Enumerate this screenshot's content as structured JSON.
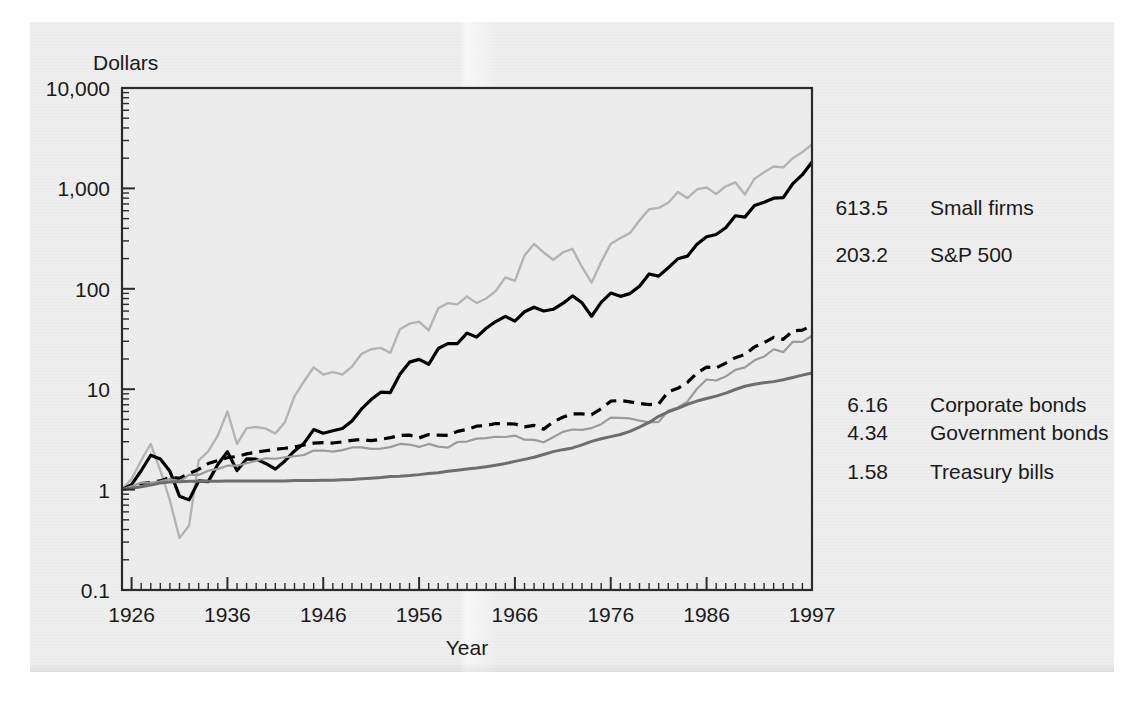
{
  "figure": {
    "y_axis_title": "Dollars",
    "x_axis_title": "Year"
  },
  "chart_data": {
    "type": "line",
    "title": "",
    "subtitle": "",
    "xlabel": "Year",
    "ylabel": "Dollars",
    "yscale": "log",
    "ylim": [
      0.1,
      10000
    ],
    "xlim": [
      1925,
      1997
    ],
    "grid": false,
    "legend_position": "right-inline",
    "ytick_labels": [
      "10,000",
      "1,000",
      "100",
      "10",
      "1",
      "0.1"
    ],
    "ytick_values": [
      10000,
      1000,
      100,
      10,
      1,
      0.1
    ],
    "xtick_labels": [
      "1926",
      "1936",
      "1946",
      "1956",
      "1966",
      "1976",
      "1986",
      "1997"
    ],
    "xtick_values": [
      1926,
      1936,
      1946,
      1956,
      1966,
      1976,
      1986,
      1997
    ],
    "annotations": [
      {
        "value": "613.5",
        "name": "Small firms"
      },
      {
        "value": "203.2",
        "name": "S&P 500"
      },
      {
        "value": "6.16",
        "name": "Corporate bonds"
      },
      {
        "value": "4.34",
        "name": "Government bonds"
      },
      {
        "value": "1.58",
        "name": "Treasury bills"
      }
    ],
    "series": [
      {
        "name": "Small firms",
        "end_value": 613.5,
        "color": "#b4b4b4",
        "style": "solid",
        "width": 2.4,
        "x": [
          1925,
          1926,
          1927,
          1928,
          1929,
          1930,
          1931,
          1932,
          1933,
          1934,
          1935,
          1936,
          1937,
          1938,
          1939,
          1940,
          1941,
          1942,
          1943,
          1944,
          1945,
          1946,
          1947,
          1948,
          1949,
          1950,
          1951,
          1952,
          1953,
          1954,
          1955,
          1956,
          1957,
          1958,
          1959,
          1960,
          1961,
          1962,
          1963,
          1964,
          1965,
          1966,
          1967,
          1968,
          1969,
          1970,
          1971,
          1972,
          1973,
          1974,
          1975,
          1976,
          1977,
          1978,
          1979,
          1980,
          1981,
          1982,
          1983,
          1984,
          1985,
          1986,
          1987,
          1988,
          1989,
          1990,
          1991,
          1992,
          1993,
          1994,
          1995,
          1996,
          1997
        ],
        "values": [
          1.0,
          1.28,
          1.95,
          2.85,
          1.55,
          0.78,
          0.33,
          0.44,
          1.95,
          2.4,
          3.46,
          6.0,
          2.85,
          4.1,
          4.2,
          4.05,
          3.62,
          4.7,
          8.5,
          12.0,
          16.5,
          14.0,
          14.8,
          14.0,
          16.8,
          22.5,
          25.0,
          25.8,
          23.0,
          39.5,
          45.0,
          47.0,
          38.5,
          64.0,
          72.0,
          70.0,
          84.0,
          72.0,
          80.0,
          95.0,
          130.0,
          120.0,
          215.0,
          280.0,
          230.0,
          195.0,
          230.0,
          250.0,
          165.0,
          115.0,
          185.0,
          280.0,
          320.0,
          360.0,
          480.0,
          620.0,
          640.0,
          720.0,
          920.0,
          800.0,
          980.0,
          1020.0,
          880.0,
          1050.0,
          1150.0,
          870.0,
          1250.0,
          1450.0,
          1650.0,
          1620.0,
          2000.0,
          2300.0,
          2750.0
        ]
      },
      {
        "name": "S&P 500",
        "end_value": 203.2,
        "color": "#000000",
        "style": "solid",
        "width": 3.2,
        "x": [
          1925,
          1926,
          1927,
          1928,
          1929,
          1930,
          1931,
          1932,
          1933,
          1934,
          1935,
          1936,
          1937,
          1938,
          1939,
          1940,
          1941,
          1942,
          1943,
          1944,
          1945,
          1946,
          1947,
          1948,
          1949,
          1950,
          1951,
          1952,
          1953,
          1954,
          1955,
          1956,
          1957,
          1958,
          1959,
          1960,
          1961,
          1962,
          1963,
          1964,
          1965,
          1966,
          1967,
          1968,
          1969,
          1970,
          1971,
          1972,
          1973,
          1974,
          1975,
          1976,
          1977,
          1978,
          1979,
          1980,
          1981,
          1982,
          1983,
          1984,
          1985,
          1986,
          1987,
          1988,
          1989,
          1990,
          1991,
          1992,
          1993,
          1994,
          1995,
          1996,
          1997
        ],
        "values": [
          1.0,
          1.12,
          1.54,
          2.2,
          2.02,
          1.52,
          0.86,
          0.79,
          1.22,
          1.2,
          1.78,
          2.38,
          1.55,
          2.02,
          2.01,
          1.82,
          1.6,
          1.93,
          2.43,
          2.9,
          3.96,
          3.64,
          3.85,
          4.06,
          4.83,
          6.36,
          7.89,
          9.34,
          9.25,
          14.1,
          18.6,
          19.8,
          17.7,
          25.4,
          28.4,
          28.5,
          36.2,
          33.0,
          40.5,
          47.2,
          53.1,
          47.7,
          59.1,
          65.6,
          60.1,
          62.5,
          71.4,
          85.0,
          72.5,
          53.3,
          73.1,
          90.6,
          84.1,
          89.6,
          106.1,
          140.5,
          133.6,
          162.3,
          198.9,
          211.5,
          278.5,
          330.4,
          347.7,
          405.5,
          533.9,
          517.5,
          674.9,
          726.4,
          799.4,
          809.8,
          1113.9,
          1369.9,
          1828.3
        ]
      },
      {
        "name": "Corporate bonds",
        "end_value": 6.16,
        "color": "#000000",
        "style": "dashed",
        "width": 3.2,
        "x": [
          1925,
          1926,
          1927,
          1928,
          1929,
          1930,
          1931,
          1932,
          1933,
          1934,
          1935,
          1936,
          1937,
          1938,
          1939,
          1940,
          1941,
          1942,
          1943,
          1944,
          1945,
          1946,
          1947,
          1948,
          1949,
          1950,
          1951,
          1952,
          1953,
          1954,
          1955,
          1956,
          1957,
          1958,
          1959,
          1960,
          1961,
          1962,
          1963,
          1964,
          1965,
          1966,
          1967,
          1968,
          1969,
          1970,
          1971,
          1972,
          1973,
          1974,
          1975,
          1976,
          1977,
          1978,
          1979,
          1980,
          1981,
          1982,
          1983,
          1984,
          1985,
          1986,
          1987,
          1988,
          1989,
          1990,
          1991,
          1992,
          1993,
          1994,
          1995,
          1996,
          1997
        ],
        "values": [
          1.0,
          1.07,
          1.15,
          1.18,
          1.22,
          1.32,
          1.3,
          1.44,
          1.59,
          1.82,
          1.95,
          2.08,
          2.14,
          2.27,
          2.36,
          2.44,
          2.52,
          2.58,
          2.66,
          2.78,
          2.9,
          2.94,
          2.91,
          2.99,
          3.09,
          3.16,
          3.07,
          3.17,
          3.29,
          3.47,
          3.49,
          3.27,
          3.53,
          3.49,
          3.46,
          3.8,
          3.98,
          4.28,
          4.36,
          4.55,
          4.51,
          4.5,
          4.22,
          4.36,
          4.0,
          4.72,
          5.26,
          5.68,
          5.67,
          5.59,
          6.4,
          7.6,
          7.72,
          7.49,
          7.21,
          7.02,
          7.14,
          9.41,
          10.2,
          11.7,
          14.5,
          16.6,
          16.3,
          18.2,
          20.6,
          22.2,
          26.4,
          29.1,
          32.8,
          31.4,
          38.0,
          38.8,
          43.0
        ]
      },
      {
        "name": "Government bonds",
        "end_value": 4.34,
        "color": "#9b9b9b",
        "style": "solid",
        "width": 2.2,
        "x": [
          1925,
          1926,
          1927,
          1928,
          1929,
          1930,
          1931,
          1932,
          1933,
          1934,
          1935,
          1936,
          1937,
          1938,
          1939,
          1940,
          1941,
          1942,
          1943,
          1944,
          1945,
          1946,
          1947,
          1948,
          1949,
          1950,
          1951,
          1952,
          1953,
          1954,
          1955,
          1956,
          1957,
          1958,
          1959,
          1960,
          1961,
          1962,
          1963,
          1964,
          1965,
          1966,
          1967,
          1968,
          1969,
          1970,
          1971,
          1972,
          1973,
          1974,
          1975,
          1976,
          1977,
          1978,
          1979,
          1980,
          1981,
          1982,
          1983,
          1984,
          1985,
          1986,
          1987,
          1988,
          1989,
          1990,
          1991,
          1992,
          1993,
          1994,
          1995,
          1996,
          1997
        ],
        "values": [
          1.0,
          1.08,
          1.17,
          1.17,
          1.21,
          1.27,
          1.2,
          1.4,
          1.4,
          1.54,
          1.61,
          1.73,
          1.73,
          1.83,
          1.94,
          2.05,
          2.03,
          2.1,
          2.15,
          2.21,
          2.45,
          2.45,
          2.39,
          2.47,
          2.63,
          2.63,
          2.54,
          2.56,
          2.65,
          2.85,
          2.81,
          2.66,
          2.85,
          2.68,
          2.62,
          2.98,
          3.01,
          3.22,
          3.25,
          3.36,
          3.34,
          3.45,
          3.14,
          3.13,
          2.96,
          3.32,
          3.76,
          3.97,
          3.93,
          4.1,
          4.48,
          5.21,
          5.17,
          5.11,
          4.86,
          4.67,
          4.73,
          6.14,
          6.58,
          7.53,
          10.1,
          12.5,
          12.2,
          13.4,
          15.6,
          16.5,
          19.4,
          21.1,
          25.0,
          23.4,
          29.7,
          29.6,
          34.1
        ]
      },
      {
        "name": "Treasury bills",
        "end_value": 1.58,
        "color": "#6e6e6e",
        "style": "solid",
        "width": 3.0,
        "x": [
          1925,
          1926,
          1927,
          1928,
          1929,
          1930,
          1931,
          1932,
          1933,
          1934,
          1935,
          1936,
          1937,
          1938,
          1939,
          1940,
          1941,
          1942,
          1943,
          1944,
          1945,
          1946,
          1947,
          1948,
          1949,
          1950,
          1951,
          1952,
          1953,
          1954,
          1955,
          1956,
          1957,
          1958,
          1959,
          1960,
          1961,
          1962,
          1963,
          1964,
          1965,
          1966,
          1967,
          1968,
          1969,
          1970,
          1971,
          1972,
          1973,
          1974,
          1975,
          1976,
          1977,
          1978,
          1979,
          1980,
          1981,
          1982,
          1983,
          1984,
          1985,
          1986,
          1987,
          1988,
          1989,
          1990,
          1991,
          1992,
          1993,
          1994,
          1995,
          1996,
          1997
        ],
        "values": [
          1.0,
          1.03,
          1.07,
          1.11,
          1.16,
          1.19,
          1.2,
          1.21,
          1.21,
          1.21,
          1.21,
          1.22,
          1.22,
          1.22,
          1.22,
          1.22,
          1.22,
          1.22,
          1.23,
          1.23,
          1.23,
          1.24,
          1.24,
          1.25,
          1.26,
          1.28,
          1.3,
          1.32,
          1.35,
          1.36,
          1.38,
          1.41,
          1.45,
          1.47,
          1.52,
          1.56,
          1.6,
          1.64,
          1.69,
          1.75,
          1.82,
          1.91,
          2.0,
          2.1,
          2.24,
          2.39,
          2.5,
          2.6,
          2.79,
          3.02,
          3.21,
          3.37,
          3.54,
          3.8,
          4.2,
          4.67,
          5.37,
          5.94,
          6.45,
          7.08,
          7.62,
          8.08,
          8.53,
          9.14,
          9.93,
          10.7,
          11.2,
          11.6,
          11.9,
          12.4,
          13.1,
          13.8,
          14.5
        ]
      }
    ]
  }
}
